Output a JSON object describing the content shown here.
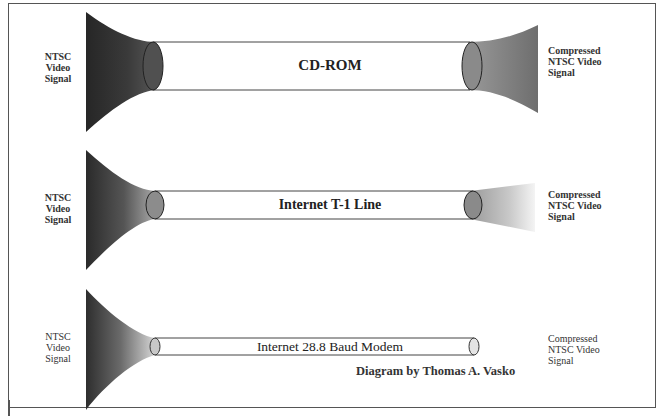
{
  "diagram": {
    "rows": [
      {
        "id": "cdrom",
        "input_label": [
          "NTSC",
          "Video",
          "Signal"
        ],
        "channel_label": "CD-ROM",
        "output_label": [
          "Compressed",
          "NTSC Video",
          "Signal"
        ]
      },
      {
        "id": "t1",
        "input_label": [
          "NTSC",
          "Video",
          "Signal"
        ],
        "channel_label": "Internet T-1 Line",
        "output_label": [
          "Compressed",
          "NTSC Video",
          "Signal"
        ]
      },
      {
        "id": "modem",
        "input_label": [
          "NTSC",
          "Video",
          "Signal"
        ],
        "channel_label": "Internet 28.8 Baud Modem",
        "output_label": [
          "Compressed",
          "NTSC Video",
          "Signal"
        ]
      }
    ],
    "credit": "Diagram by Thomas A. Vasko",
    "colors": {
      "horn_dark": "#2b2b2b",
      "horn_mid": "#777777",
      "tube_end": "#8a8a8a",
      "output_cdrom": "#7a7a7a",
      "output_t1": "#b0b0b0",
      "border": "#555555"
    }
  }
}
